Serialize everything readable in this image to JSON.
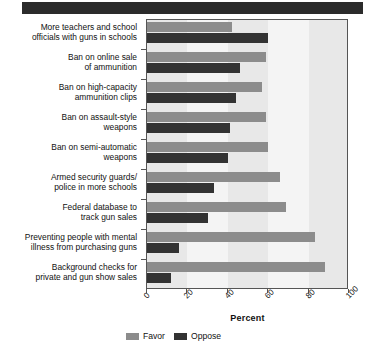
{
  "header": {
    "band_color": "#2b2b2b"
  },
  "chart_data": {
    "type": "bar",
    "orientation": "horizontal",
    "title": "",
    "xlabel": "Percent",
    "ylabel": "",
    "xlim": [
      0,
      100
    ],
    "xticks": [
      0,
      20,
      40,
      60,
      80,
      100
    ],
    "xtick_labels": [
      "0",
      "20",
      "40",
      "60",
      "80",
      "100"
    ],
    "grid": false,
    "legend_position": "bottom",
    "categories": [
      "More teachers and school officials with guns in schools",
      "Ban on online sale of ammunition",
      "Ban on high-capacity ammunition clips",
      "Ban on assault-style weapons",
      "Ban on semi-automatic weapons",
      "Armed security guards/ police in more schools",
      "Federal database to track gun sales",
      "Preventing people with mental illness from purchasing guns",
      "Background checks for private and gun show sales"
    ],
    "category_lines": [
      [
        "More teachers and school",
        "officials with guns in schools"
      ],
      [
        "Ban on online sale",
        "of ammunition"
      ],
      [
        "Ban on high-capacity",
        "ammunition clips"
      ],
      [
        "Ban on assault-style",
        "weapons"
      ],
      [
        "Ban on semi-automatic",
        "weapons"
      ],
      [
        "Armed security guards/",
        "police in more schools"
      ],
      [
        "Federal database to",
        "track gun sales"
      ],
      [
        "Preventing people with mental",
        "illness from purchasing guns"
      ],
      [
        "Background checks for",
        "private and gun show sales"
      ]
    ],
    "series": [
      {
        "name": "Favor",
        "color": "#8c8c8c",
        "values": [
          42,
          59,
          57,
          59,
          60,
          66,
          69,
          83,
          88
        ]
      },
      {
        "name": "Oppose",
        "color": "#333333",
        "values": [
          60,
          46,
          44,
          41,
          40,
          33,
          30,
          16,
          12
        ]
      }
    ]
  }
}
